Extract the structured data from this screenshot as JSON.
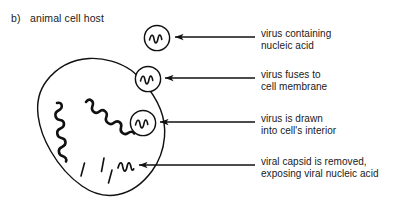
{
  "figure": {
    "panel_letter": "b)",
    "panel_title": "animal cell host",
    "ink_color": "#111111",
    "background_color": "#ffffff"
  },
  "diagram": {
    "cell": {
      "name": "animal host cell",
      "interior_features": {
        "long_squiggles": 2,
        "short_tick_lines": 3,
        "free_nucleic_acid_squiggles": 1
      }
    },
    "virus_particles": [
      {
        "id": "virus-free",
        "state": "intact capsid outside cell"
      },
      {
        "id": "virus-fusing",
        "state": "capsid at cell membrane"
      },
      {
        "id": "virus-internalized",
        "state": "capsid inside cell"
      },
      {
        "id": "nucleic-acid-released",
        "state": "capsid removed, bare nucleic acid"
      }
    ]
  },
  "callouts": [
    {
      "id": "callout-1",
      "line1": "virus containing",
      "line2": "nucleic acid"
    },
    {
      "id": "callout-2",
      "line1": "virus fuses to",
      "line2": "cell membrane"
    },
    {
      "id": "callout-3",
      "line1": "virus is drawn",
      "line2": "into cell's interior"
    },
    {
      "id": "callout-4",
      "line1": "viral capsid is removed,",
      "line2": "exposing viral nucleic acid"
    }
  ]
}
